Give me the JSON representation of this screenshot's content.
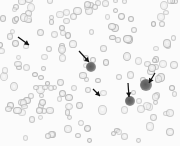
{
  "image": {
    "description": "Blood smear microscopy with arrows pointing to cells",
    "width": 180,
    "height": 146,
    "background": "#fbfbfb",
    "rbc_color": "#b8b8b8",
    "wbc_color": "#5a5a5a",
    "arrow_color": "#111111",
    "arrows": [
      {
        "x1": 18,
        "y1": 37,
        "x2": 29,
        "y2": 45
      },
      {
        "x1": 79,
        "y1": 51,
        "x2": 89,
        "y2": 62
      },
      {
        "x1": 93,
        "y1": 89,
        "x2": 100,
        "y2": 96
      },
      {
        "x1": 128,
        "y1": 83,
        "x2": 129,
        "y2": 97
      },
      {
        "x1": 155,
        "y1": 73,
        "x2": 149,
        "y2": 83
      }
    ],
    "wbcs": [
      {
        "x": 91,
        "y": 67,
        "r": 5
      },
      {
        "x": 130,
        "y": 101,
        "r": 5
      },
      {
        "x": 146,
        "y": 85,
        "r": 6
      }
    ]
  }
}
